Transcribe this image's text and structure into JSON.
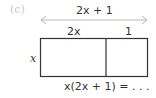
{
  "part_label": "(c)",
  "total_width_label": "2x + 1",
  "segments": [
    {
      "label": "2x"
    },
    {
      "label": "1"
    }
  ],
  "height_label": "x",
  "area_expression": "x(2x + 1) = . . .",
  "colors": {
    "arrow": "#b8b8b8",
    "rectangle": "#333333",
    "part_label": "#c8c8c8"
  }
}
